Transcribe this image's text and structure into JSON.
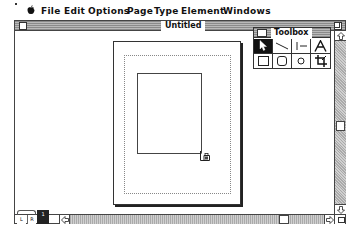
{
  "menubar": {
    "apple_icon": "apple-icon",
    "items": [
      {
        "label": "File"
      },
      {
        "label": "Edit"
      },
      {
        "label": "Options"
      },
      {
        "label": "Page"
      },
      {
        "label": "Type"
      },
      {
        "label": "Element"
      },
      {
        "label": "Windows"
      }
    ]
  },
  "window": {
    "title": "Untitled"
  },
  "toolbox": {
    "title": "Toolbox",
    "tools": [
      {
        "name": "pointer-tool",
        "icon": "arrow-pointer-icon",
        "selected": true
      },
      {
        "name": "diagonal-line-tool",
        "icon": "diagonal-line-icon",
        "selected": false
      },
      {
        "name": "perpendicular-line-tool",
        "icon": "perpendicular-line-icon",
        "selected": false
      },
      {
        "name": "text-tool",
        "icon": "letter-a-icon",
        "label": "A",
        "selected": false
      },
      {
        "name": "rectangle-tool",
        "icon": "square-icon",
        "selected": false
      },
      {
        "name": "rounded-rectangle-tool",
        "icon": "rounded-square-icon",
        "selected": false
      },
      {
        "name": "oval-tool",
        "icon": "circle-icon",
        "selected": false
      },
      {
        "name": "crop-tool",
        "icon": "crop-icon",
        "selected": false
      }
    ]
  },
  "page_icons": {
    "left": "L",
    "right": "R",
    "current": "1"
  }
}
